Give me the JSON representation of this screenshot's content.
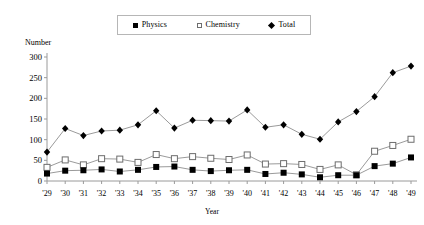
{
  "legend": {
    "position": "top-center",
    "entries": [
      {
        "label": "Physics",
        "marker": "filled-square-icon",
        "color": "#000000"
      },
      {
        "label": "Chemistry",
        "marker": "open-square-icon",
        "color": "#ffffff"
      },
      {
        "label": "Total",
        "marker": "diamond-icon",
        "color": "#000000"
      }
    ]
  },
  "axes": {
    "y_title": "Number",
    "x_title": "Year",
    "y_ticks": [
      "0",
      "50",
      "100",
      "150",
      "200",
      "250",
      "300"
    ]
  },
  "chart_data": {
    "type": "line",
    "title": "",
    "subtitle": "",
    "xlabel": "Year",
    "ylabel": "Number",
    "ylim": [
      0,
      300
    ],
    "ytick_values": [
      0,
      50,
      100,
      150,
      200,
      250,
      300
    ],
    "grid": false,
    "legend_position": "top-center",
    "categories": [
      "'29",
      "'30",
      "'31",
      "'32",
      "'33",
      "'34",
      "'35",
      "'36",
      "'37",
      "'38",
      "'39",
      "'40",
      "'41",
      "'42",
      "'43",
      "'44",
      "'45",
      "'46",
      "'47",
      "'48",
      "'49"
    ],
    "series": [
      {
        "name": "Physics",
        "marker": "filled-square",
        "color": "#000000",
        "values": [
          18,
          25,
          26,
          28,
          23,
          27,
          34,
          35,
          27,
          24,
          26,
          27,
          17,
          20,
          16,
          9,
          14,
          14,
          36,
          42,
          57
        ]
      },
      {
        "name": "Chemistry",
        "marker": "open-square",
        "color": "#ffffff",
        "values": [
          33,
          51,
          39,
          54,
          53,
          45,
          64,
          54,
          59,
          55,
          52,
          63,
          41,
          42,
          40,
          28,
          39,
          15,
          72,
          86,
          101
        ]
      },
      {
        "name": "Total",
        "marker": "diamond",
        "color": "#000000",
        "values": [
          70,
          127,
          110,
          121,
          123,
          136,
          170,
          128,
          147,
          146,
          145,
          172,
          130,
          136,
          113,
          101,
          143,
          168,
          204,
          262,
          278
        ]
      }
    ]
  }
}
